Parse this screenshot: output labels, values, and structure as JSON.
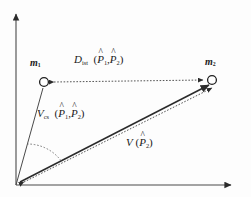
{
  "figure": {
    "background_color": "#fdfdfd",
    "stroke_color": "#3a3a3a",
    "text_color": "#1a1a1a"
  },
  "axes": {
    "y_axis_name": "y-axis",
    "x_axis_name": "x-axis",
    "origin_label": ""
  },
  "points": {
    "m1": {
      "label_base": "m",
      "label_sub": "1",
      "marker": "open-circle"
    },
    "m2": {
      "label_base": "m",
      "label_sub": "2",
      "marker": "open-circle"
    }
  },
  "labels": {
    "distance": {
      "base": "D",
      "sub": "ist",
      "open_paren": "(",
      "arg1_base": "P",
      "arg1_sub": "1",
      "comma": ",",
      "arg2_base": "P",
      "arg2_sub": "2",
      "close_paren": ")",
      "hat": "^"
    },
    "angle": {
      "base": "V",
      "sub": "cs",
      "open_paren": "(",
      "arg1_base": "P",
      "arg1_sub": "1",
      "comma": ",",
      "arg2_base": "P",
      "arg2_sub": "2",
      "close_paren": ")",
      "hat": "^"
    },
    "vector": {
      "base": "V",
      "open_paren": "(",
      "arg1_base": "P",
      "arg1_sub": "2",
      "close_paren": ")",
      "hat": "^"
    }
  }
}
